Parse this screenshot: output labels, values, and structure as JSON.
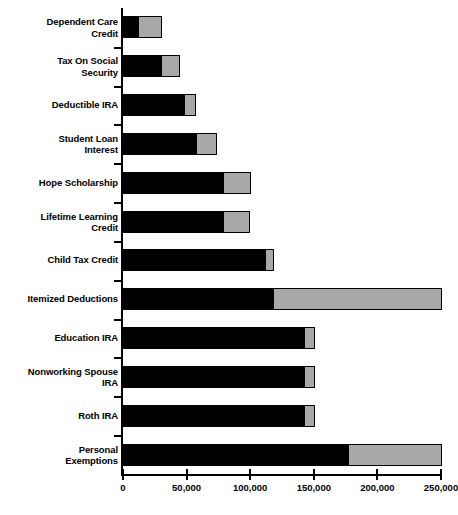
{
  "chart_data": {
    "type": "bar",
    "orientation": "horizontal",
    "stacked": true,
    "title": "",
    "subtitle": "",
    "xlabel": "",
    "ylabel": "",
    "xlim": [
      0,
      250000
    ],
    "grid": false,
    "legend": null,
    "tick_labels": [
      "0",
      "50,000",
      "100,000",
      "150,000",
      "200,000",
      "250,000"
    ],
    "tick_values": [
      0,
      50000,
      100000,
      150000,
      200000,
      250000
    ],
    "categories": [
      "Dependent Care\nCredit",
      "Tax On Social\nSecurity",
      "Deductible IRA",
      "Student Loan\nInterest",
      "Hope Scholarship",
      "Lifetime Learning\nCredit",
      "Child Tax Credit",
      "Itemized Deductions",
      "Education IRA",
      "Nonworking Spouse\nIRA",
      "Roth IRA",
      "Personal\nExemptions"
    ],
    "series": [
      {
        "name": "segment-a",
        "color": "#000000",
        "values": [
          12000,
          30000,
          48000,
          57000,
          79000,
          79000,
          112000,
          118000,
          142000,
          142000,
          142000,
          177000
        ]
      },
      {
        "name": "segment-b",
        "color": "#a8a8a8",
        "values": [
          18000,
          14000,
          9000,
          16000,
          21000,
          20000,
          6000,
          132000,
          8000,
          8000,
          8000,
          73000
        ]
      }
    ],
    "totals": [
      30000,
      44000,
      57000,
      73000,
      100000,
      99000,
      118000,
      250000,
      150000,
      150000,
      150000,
      250000
    ]
  },
  "caption": {
    "text": ""
  }
}
